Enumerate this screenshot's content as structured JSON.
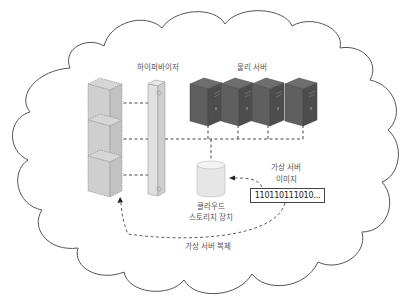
{
  "diagram": {
    "container": {
      "shape": "cloud",
      "stroke": "#555555",
      "fill": "#ffffff"
    },
    "labels": {
      "hypervisor": "하이퍼바이저",
      "physical_servers": "물리 서버",
      "cloud_storage_line1": "클라우드",
      "cloud_storage_line2": "스토리지 장치",
      "vm_image_line1": "가상 서버",
      "vm_image_line2": "이미지",
      "binary": "110110111010...",
      "vm_replication": "가상 서버 복제"
    },
    "nodes": {
      "virtual_servers": {
        "count": 3,
        "style": "dashed-outline light gray cubes"
      },
      "hypervisor": {
        "style": "vertical bar"
      },
      "physical_servers": {
        "count": 4,
        "color": "#5a5a5a"
      },
      "cloud_storage": {
        "shape": "cylinder",
        "color": "#e6e6e6"
      },
      "vm_image": {
        "shape": "box"
      }
    },
    "edges": [
      {
        "from": "virtual_server_1",
        "to": "hypervisor",
        "style": "dashed"
      },
      {
        "from": "virtual_server_2",
        "to": "hypervisor",
        "style": "dashed"
      },
      {
        "from": "virtual_server_3",
        "to": "hypervisor",
        "style": "dashed"
      },
      {
        "from": "hypervisor",
        "to": "physical_servers",
        "style": "dashed"
      },
      {
        "from": "physical_servers",
        "to": "cloud_storage",
        "style": "dashed"
      },
      {
        "from": "vm_image",
        "to": "cloud_storage",
        "style": "dashed-arrow"
      },
      {
        "from": "vm_image",
        "to": "virtual_server_3",
        "style": "dashed-arrow",
        "label": "가상 서버 복제"
      }
    ]
  }
}
